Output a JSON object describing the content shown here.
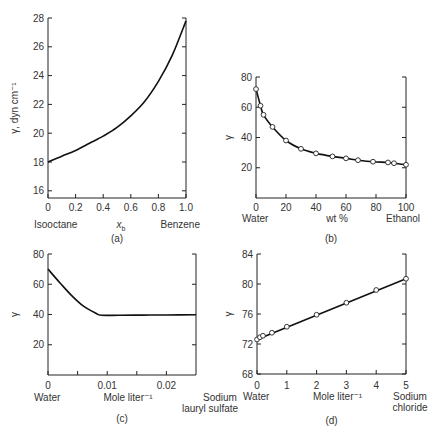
{
  "chart_data": [
    {
      "id": "a",
      "type": "line",
      "caption": "(a)",
      "xlabel": "x_b",
      "xlabel_main": "x",
      "xlabel_sub": "b",
      "x_left_label": "Isooctane",
      "x_right_label": "Benzene",
      "ylabel": "γ, dyn cm⁻¹",
      "xlim": [
        0,
        1.0
      ],
      "ylim": [
        15.5,
        28
      ],
      "xticks": [
        "0",
        "0.2",
        "0.4",
        "0.6",
        "0.8",
        "1.0"
      ],
      "yticks": [
        "16",
        "18",
        "20",
        "22",
        "24",
        "26",
        "28"
      ],
      "series": [
        {
          "name": "isooctane-benzene",
          "markers": false,
          "x": [
            0,
            0.1,
            0.2,
            0.3,
            0.4,
            0.5,
            0.6,
            0.7,
            0.8,
            0.9,
            1.0
          ],
          "y": [
            18.0,
            18.4,
            18.8,
            19.3,
            19.8,
            20.4,
            21.2,
            22.2,
            23.6,
            25.4,
            27.8
          ]
        }
      ]
    },
    {
      "id": "b",
      "type": "line",
      "caption": "(b)",
      "xlabel": "wt %",
      "x_left_label": "Water",
      "x_right_label": "Ethanol",
      "ylabel": "γ",
      "xlim": [
        0,
        100
      ],
      "ylim": [
        0,
        80
      ],
      "xticks": [
        "0",
        "20",
        "40",
        "60",
        "80",
        "100"
      ],
      "yticks": [
        "20",
        "40",
        "60",
        "80"
      ],
      "series": [
        {
          "name": "water-ethanol",
          "markers": true,
          "x": [
            0,
            3,
            5,
            11,
            20,
            30,
            40,
            51,
            60,
            68,
            78,
            88,
            92,
            100
          ],
          "y": [
            72,
            61,
            55,
            47,
            38,
            32.5,
            29.5,
            27.5,
            26.2,
            25,
            24,
            23.5,
            23,
            22
          ]
        }
      ]
    },
    {
      "id": "c",
      "type": "line",
      "caption": "(c)",
      "xlabel": "Mole liter⁻¹",
      "x_left_label": "Water",
      "x_right_label": "Sodium lauryl sulfate",
      "ylabel": "γ",
      "xlim": [
        0,
        0.025
      ],
      "ylim": [
        0,
        80
      ],
      "xticks": [
        "0",
        "0.01",
        "0.02"
      ],
      "yticks": [
        "20",
        "40",
        "60",
        "80"
      ],
      "series": [
        {
          "name": "water-SLS",
          "markers": false,
          "x": [
            0,
            0.002,
            0.004,
            0.006,
            0.008,
            0.009,
            0.012,
            0.016,
            0.02,
            0.025
          ],
          "y": [
            70,
            61,
            52.5,
            45.5,
            41,
            39.5,
            39.5,
            39.6,
            39.7,
            39.8
          ]
        }
      ]
    },
    {
      "id": "d",
      "type": "line",
      "caption": "(d)",
      "xlabel": "Mole liter⁻¹",
      "x_left_label": "Water",
      "x_right_label": "Sodium chloride",
      "ylabel": "γ",
      "xlim": [
        0,
        5
      ],
      "ylim": [
        68,
        84
      ],
      "xticks": [
        "0",
        "1",
        "2",
        "3",
        "4",
        "5"
      ],
      "yticks": [
        "68",
        "72",
        "76",
        "80",
        "84"
      ],
      "series": [
        {
          "name": "water-NaCl",
          "markers": true,
          "x": [
            0,
            0.1,
            0.2,
            0.5,
            1,
            2,
            3,
            4,
            5
          ],
          "y": [
            72.6,
            72.9,
            73.1,
            73.5,
            74.3,
            75.9,
            77.5,
            79.2,
            80.7
          ]
        }
      ]
    }
  ],
  "figure": {
    "panels": [
      "(a)",
      "(b)",
      "(c)",
      "(d)"
    ]
  }
}
